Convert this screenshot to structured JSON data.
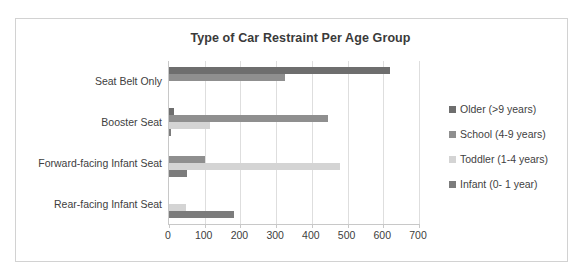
{
  "chart_data": {
    "type": "bar",
    "orientation": "horizontal",
    "title": "Type of Car Restraint Per Age Group",
    "xlabel": "",
    "ylabel": "",
    "xlim": [
      0,
      700
    ],
    "xticks": [
      0,
      100,
      200,
      300,
      400,
      500,
      600,
      700
    ],
    "xtick_labels": [
      "0",
      "100",
      "200",
      "300",
      "400",
      "500",
      "600",
      "700"
    ],
    "grid": true,
    "legend_position": "right",
    "categories": [
      "Seat Belt Only",
      "Booster Seat",
      "Forward-facing Infant Seat",
      "Rear-facing Infant Seat"
    ],
    "series": [
      {
        "name": "Older (>9 years)",
        "color": "#6e6e6e",
        "values": [
          620,
          15,
          0,
          0
        ]
      },
      {
        "name": "School (4-9 years)",
        "color": "#8f8f8f",
        "values": [
          325,
          445,
          100,
          0
        ]
      },
      {
        "name": "Toddler (1-4 years)",
        "color": "#d4d4d4",
        "values": [
          0,
          115,
          480,
          48
        ]
      },
      {
        "name": "Infant (0- 1 year)",
        "color": "#7c7c7c",
        "values": [
          0,
          3,
          50,
          182
        ]
      }
    ]
  },
  "legend": {
    "items": [
      {
        "label": "Older (>9 years)",
        "color": "#6e6e6e"
      },
      {
        "label": "School (4-9 years)",
        "color": "#8f8f8f"
      },
      {
        "label": "Toddler (1-4 years)",
        "color": "#d4d4d4"
      },
      {
        "label": "Infant (0- 1 year)",
        "color": "#7c7c7c"
      }
    ]
  },
  "colors": {
    "frame_border": "#d2d2d2",
    "axis_line": "#c8c8c8",
    "gridline": "#dedede",
    "text": "#3f3f3f",
    "background": "#ffffff"
  }
}
